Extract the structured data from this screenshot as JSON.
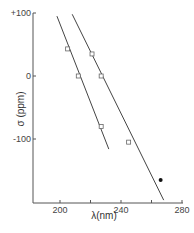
{
  "chart_data": {
    "type": "scatter",
    "title": "",
    "xlabel": "λ(nm)",
    "ylabel": "σ (ppm)",
    "xlim": [
      183,
      282
    ],
    "ylim": [
      -205,
      105
    ],
    "xticks": [
      200,
      240,
      280
    ],
    "xminor": [
      220,
      260
    ],
    "yticks": [
      {
        "value": 100,
        "label": "+100"
      },
      {
        "value": 0,
        "label": "0"
      },
      {
        "value": -100,
        "label": "-100"
      }
    ],
    "grid": false,
    "series": [
      {
        "name": "series-1",
        "marker": "open-square",
        "points": [
          {
            "x": 205,
            "y": 43
          },
          {
            "x": 212,
            "y": 0
          },
          {
            "x": 227,
            "y": -80
          }
        ],
        "fit_line": [
          {
            "x": 198,
            "y": 95
          },
          {
            "x": 232,
            "y": -116
          }
        ]
      },
      {
        "name": "series-2",
        "marker": "open-square",
        "points": [
          {
            "x": 221,
            "y": 35
          },
          {
            "x": 227,
            "y": 0
          },
          {
            "x": 245,
            "y": -105
          }
        ],
        "fit_line": [
          {
            "x": 208,
            "y": 98
          },
          {
            "x": 268,
            "y": -197
          }
        ]
      },
      {
        "name": "series-3",
        "marker": "filled-circle",
        "points": [
          {
            "x": 266,
            "y": -165
          }
        ]
      }
    ]
  }
}
